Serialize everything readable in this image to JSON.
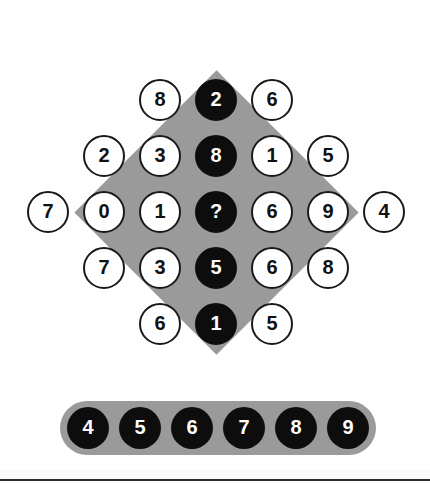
{
  "puzzle": {
    "title": "Number Diamond Puzzle",
    "missing_marker": "?",
    "colors": {
      "board_gray": "#9a9a9a",
      "disc_dark": "#0d0d0d",
      "disc_light": "#ffffff",
      "ink": "#111111"
    },
    "grid": {
      "rows": [
        {
          "row_index": 1,
          "cells": [
            {
              "value": "8",
              "style": "light"
            },
            {
              "value": "2",
              "style": "dark"
            },
            {
              "value": "6",
              "style": "light"
            }
          ]
        },
        {
          "row_index": 2,
          "cells": [
            {
              "value": "2",
              "style": "light"
            },
            {
              "value": "3",
              "style": "light"
            },
            {
              "value": "8",
              "style": "dark"
            },
            {
              "value": "1",
              "style": "light"
            },
            {
              "value": "5",
              "style": "light"
            }
          ]
        },
        {
          "row_index": 3,
          "cells": [
            {
              "value": "7",
              "style": "light"
            },
            {
              "value": "0",
              "style": "light"
            },
            {
              "value": "1",
              "style": "light"
            },
            {
              "value": "?",
              "style": "dark"
            },
            {
              "value": "6",
              "style": "light"
            },
            {
              "value": "9",
              "style": "light"
            },
            {
              "value": "4",
              "style": "light"
            }
          ]
        },
        {
          "row_index": 4,
          "cells": [
            {
              "value": "7",
              "style": "light"
            },
            {
              "value": "3",
              "style": "light"
            },
            {
              "value": "5",
              "style": "dark"
            },
            {
              "value": "6",
              "style": "light"
            },
            {
              "value": "8",
              "style": "light"
            }
          ]
        },
        {
          "row_index": 5,
          "cells": [
            {
              "value": "6",
              "style": "light"
            },
            {
              "value": "1",
              "style": "dark"
            },
            {
              "value": "5",
              "style": "light"
            }
          ]
        }
      ],
      "center_column_values": [
        "2",
        "8",
        "?",
        "5",
        "1"
      ]
    },
    "answer_tray": {
      "options": [
        {
          "value": "4"
        },
        {
          "value": "5"
        },
        {
          "value": "6"
        },
        {
          "value": "7"
        },
        {
          "value": "8"
        },
        {
          "value": "9"
        }
      ]
    }
  }
}
